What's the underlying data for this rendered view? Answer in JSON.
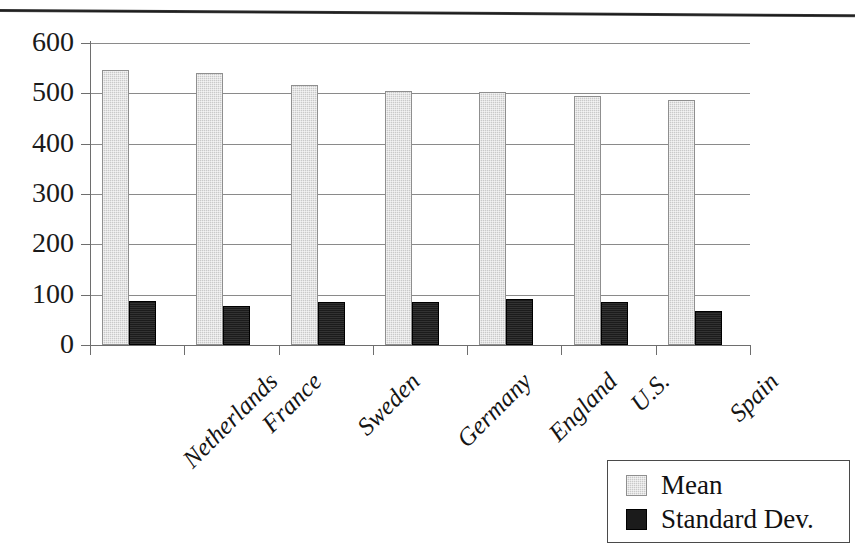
{
  "chart_data": {
    "type": "bar",
    "title": "",
    "xlabel": "",
    "ylabel": "",
    "ylim": [
      0,
      600
    ],
    "ytick_labels": [
      "600",
      "500",
      "400",
      "300",
      "200",
      "100",
      "0"
    ],
    "ytick_values": [
      600,
      500,
      400,
      300,
      200,
      100,
      0
    ],
    "grid": true,
    "legend_position": "bottom-right",
    "categories": [
      "Netherlands",
      "France",
      "Sweden",
      "Germany",
      "England",
      "U.S.",
      "Spain"
    ],
    "series": [
      {
        "name": "Mean",
        "color": "#c9c9c9",
        "values": [
          547,
          541,
          517,
          505,
          502,
          494,
          487
        ]
      },
      {
        "name": "Standard Dev.",
        "color": "#1b1b1b",
        "values": [
          88,
          77,
          86,
          86,
          91,
          85,
          68
        ]
      }
    ]
  },
  "legend": {
    "items": [
      {
        "label": "Mean",
        "swatch": "mean"
      },
      {
        "label": "Standard Dev.",
        "swatch": "sd"
      }
    ]
  },
  "decor": {
    "scan_rule": "horizontal-rule"
  }
}
